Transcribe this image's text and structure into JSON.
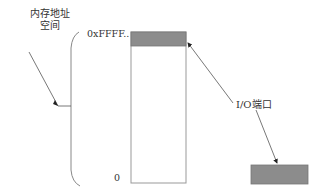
{
  "labels": {
    "memory_space_line1": "内存地址",
    "memory_space_line2": "空间",
    "top_address": "0xFFFF..",
    "bottom_address": "0",
    "io_port": "I/O端口"
  },
  "colors": {
    "line": "#555555",
    "shaded_block": "#8c8c8c",
    "border": "#777777"
  }
}
